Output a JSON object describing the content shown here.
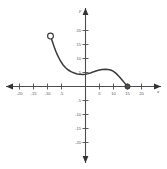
{
  "chart_data": {
    "type": "line",
    "title": "",
    "subtitle": "",
    "xlabel": "x",
    "ylabel": "y",
    "xlim": [
      -24,
      24
    ],
    "ylim": [
      -24,
      24
    ],
    "grid": false,
    "legend": "none",
    "x_ticks": [
      -20,
      -15,
      -10,
      -5,
      5,
      10,
      15,
      20
    ],
    "y_ticks": [
      20,
      15,
      10,
      5,
      -5,
      -10,
      -15,
      -20
    ],
    "x_tick_labels": [
      "-20",
      "-15",
      "-10",
      "-5",
      "5",
      "10",
      "15",
      "20"
    ],
    "y_tick_labels": [
      "20",
      "15",
      "10",
      "5",
      "-5",
      "-10",
      "-15",
      "-20"
    ],
    "axis_color": "#4d4d4d",
    "curve_color": "#3a3a3a",
    "series": [
      {
        "name": "curve",
        "x": [
          -12.5,
          -11.8,
          -11.2,
          -10.6,
          -10.0,
          -9.0,
          -8.0,
          -7.0,
          -6.0,
          -5.0,
          -4.0,
          -3.0,
          -2.0,
          -1.0,
          0.0,
          1.0,
          2.0,
          3.0,
          4.0,
          5.0,
          6.0,
          7.0,
          8.0,
          9.0,
          10.0,
          11.0,
          12.0,
          13.0,
          14.0,
          15.0
        ],
        "y": [
          18.0,
          16.0,
          14.2,
          12.6,
          11.2,
          9.2,
          7.7,
          6.6,
          5.8,
          5.2,
          4.8,
          4.5,
          4.4,
          4.3,
          4.4,
          4.6,
          4.9,
          5.3,
          5.6,
          5.9,
          6.1,
          6.2,
          6.1,
          5.9,
          5.4,
          4.6,
          3.6,
          2.4,
          1.2,
          0.0
        ]
      }
    ],
    "endpoints": [
      {
        "kind": "open-circle",
        "x": -12.5,
        "y": 18.0,
        "label": "open endpoint"
      },
      {
        "kind": "filled-circle",
        "x": 15.0,
        "y": 0.0,
        "label": "closed endpoint"
      }
    ]
  },
  "labels": {
    "x_axis_name": "x",
    "y_axis_name": "y"
  }
}
